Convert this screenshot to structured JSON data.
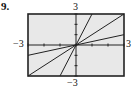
{
  "problem_number": "9.",
  "labels": {
    "y_max": "3",
    "y_min": "−3",
    "x_min": "−3",
    "x_max": "3"
  },
  "chart_data": {
    "type": "line",
    "title": "",
    "xlabel": "",
    "ylabel": "",
    "xlim": [
      -3,
      3
    ],
    "ylim": [
      -3,
      3
    ],
    "grid": false,
    "series": [
      {
        "name": "y = 3x",
        "slope": 3,
        "x": [
          -1,
          1
        ],
        "y": [
          -3,
          3
        ]
      },
      {
        "name": "y = x",
        "slope": 1,
        "x": [
          -3,
          3
        ],
        "y": [
          -3,
          3
        ]
      },
      {
        "name": "y = x/3",
        "slope": 0.3333,
        "x": [
          -3,
          3
        ],
        "y": [
          -1,
          1
        ]
      }
    ]
  }
}
